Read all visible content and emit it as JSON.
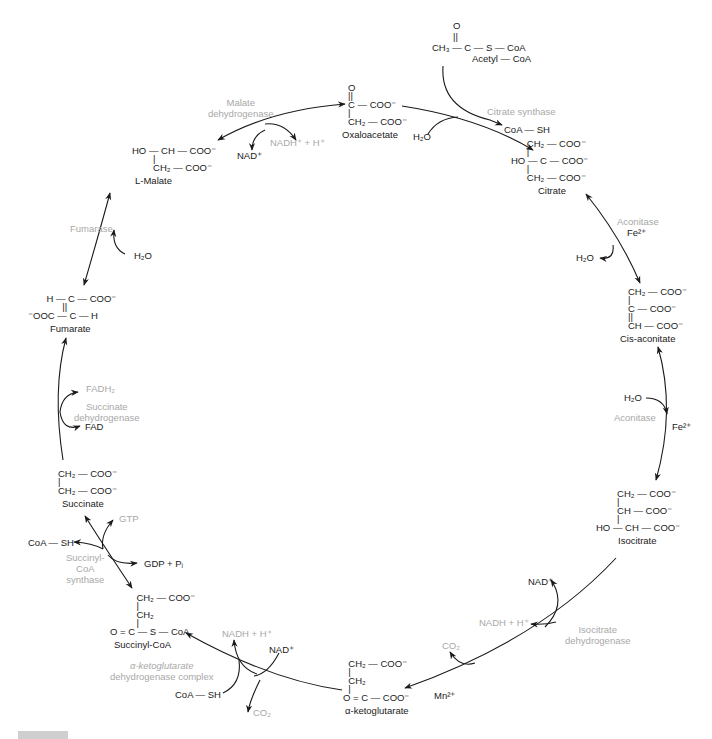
{
  "diagram": {
    "type": "metabolic-cycle",
    "title_hint": "Tricarboxylic acid (citric acid) cycle",
    "colors": {
      "structure": "#1a1a1a",
      "enzyme": "#a8a8a8",
      "arrow": "#1a1a1a"
    },
    "molecules": {
      "acetyl_coa": {
        "lines": [
          "        O",
          "        ||",
          "CH₃ — C — S — CoA"
        ],
        "name": "Acetyl — CoA"
      },
      "oxaloacetate": {
        "lines": [
          "O",
          "||",
          "C — COO⁻",
          "|",
          "CH₂ — COO⁻"
        ],
        "name": "Oxaloacetate"
      },
      "citrate": {
        "lines": [
          "      CH₂ — COO⁻",
          "      |",
          "HO — C — COO⁻",
          "      |",
          "      CH₂ — COO⁻"
        ],
        "name": "Citrate"
      },
      "cis_aconitate": {
        "lines": [
          "CH₂ — COO⁻",
          "|",
          "C — COO⁻",
          "||",
          "CH — COO⁻"
        ],
        "name": "Cis-aconitate"
      },
      "isocitrate": {
        "lines": [
          "        CH₂ — COO⁻",
          "        |",
          "        CH — COO⁻",
          "        |",
          "HO — CH — COO⁻"
        ],
        "name": "Isocitrate"
      },
      "alpha_ketoglutarate": {
        "lines": [
          "  CH₂ — COO⁻",
          "  |",
          "  CH₂",
          "  |",
          "O = C — COO⁻"
        ],
        "name": "α-ketoglutarate"
      },
      "succinyl_coa": {
        "lines": [
          "          CH₂ — COO⁻",
          "          |",
          "          CH₂",
          "          |",
          "O = C — S — CoA"
        ],
        "name": "Succinyl-CoA"
      },
      "succinate": {
        "lines": [
          "CH₂ — COO⁻",
          "|",
          "CH₂ — COO⁻"
        ],
        "name": "Succinate"
      },
      "fumarate": {
        "lines": [
          "       H — C — COO⁻",
          "             ||",
          "⁻OOC — C — H"
        ],
        "name": "Fumarate"
      },
      "l_malate": {
        "lines": [
          "HO — CH — COO⁻",
          "        |",
          "        CH₂ — COO⁻"
        ],
        "name": "L-Malate"
      }
    },
    "enzymes": {
      "citrate_synthase": "Citrate synthase",
      "aconitase_1": "Aconitase",
      "aconitase_2": "Aconitase",
      "isocitrate_dh": [
        "Isocitrate",
        "dehydrogenase"
      ],
      "akg_dh": [
        "α-ketoglutarate",
        "dehydrogenase complex"
      ],
      "succinyl_coa_synthase": [
        "Succinyl-",
        "CoA",
        "synthase"
      ],
      "succinate_dh": [
        "Succinate",
        "dehydrogenase"
      ],
      "fumarase": "Fumarase",
      "malate_dh": [
        "Malate",
        "dehydrogenase"
      ]
    },
    "cofactors": {
      "cs_h2o": "H₂O",
      "cs_coash": "CoA — SH",
      "acon1_fe": "Fe²⁺",
      "acon1_h2o": "H₂O",
      "acon2_h2o": "H₂O",
      "acon2_fe": "Fe²⁺",
      "idh_nad": "NAD⁺",
      "idh_nadh": "NADH + H⁺",
      "idh_co2": "CO₂",
      "idh_mn": "Mn²⁺",
      "akg_nadh": "NADH + H⁺",
      "akg_nad": "NAD⁺",
      "akg_coash": "CoA — SH",
      "akg_co2": "CO₂",
      "scs_gtp": "GTP",
      "scs_coash": "CoA — SH",
      "scs_gdp": "GDP + Pᵢ",
      "sdh_fadh2": "FADH₂",
      "sdh_fad": "FAD",
      "fum_h2o": "H₂O",
      "mdh_nad": "NAD⁺",
      "mdh_nadh": "NADH⁺ + H⁺"
    },
    "caption": {
      "label": "FIGURE",
      "text": ""
    }
  }
}
